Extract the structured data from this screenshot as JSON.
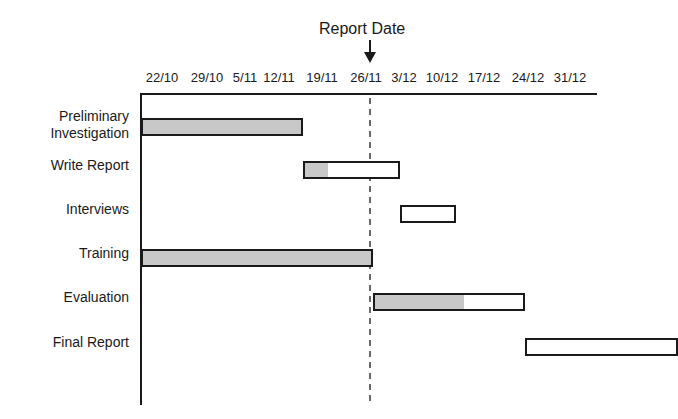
{
  "chart_data": {
    "type": "gantt",
    "title": "",
    "annotation": {
      "label": "Report Date",
      "date": "30/11",
      "marker": "down-arrow-with-dashed-line"
    },
    "x_ticks": [
      "22/10",
      "29/10",
      "5/11",
      "12/11",
      "19/11",
      "26/11",
      "3/12",
      "10/12",
      "17/12",
      "24/12",
      "31/12"
    ],
    "x_unit": "week starting date",
    "tasks": [
      {
        "name": "Preliminary Investigation",
        "label_lines": [
          "Preliminary",
          "Investigation"
        ],
        "start": "22/10",
        "end": "15/11",
        "start_week": 0,
        "duration_weeks": 3.5,
        "percent_complete": 100
      },
      {
        "name": "Write Report",
        "label_lines": [
          "Write Report"
        ],
        "start": "15/11",
        "end": "30/11",
        "start_week": 3.5,
        "duration_weeks": 2.1,
        "percent_complete": 25
      },
      {
        "name": "Interviews",
        "label_lines": [
          "Interviews"
        ],
        "start": "30/11",
        "end": "7/12",
        "start_week": 5.6,
        "duration_weeks": 1.2,
        "percent_complete": 0
      },
      {
        "name": "Training",
        "label_lines": [
          "Training"
        ],
        "start": "22/10",
        "end": "22/11",
        "start_week": 0,
        "duration_weeks": 5.0,
        "percent_complete": 100
      },
      {
        "name": "Evaluation",
        "label_lines": [
          "Evaluation"
        ],
        "start": "22/11",
        "end": "15/12",
        "start_week": 5.0,
        "duration_weeks": 3.3,
        "percent_complete": 60
      },
      {
        "name": "Final Report",
        "label_lines": [
          "Final Report"
        ],
        "start": "15/12",
        "end": "4/1",
        "start_week": 8.3,
        "duration_weeks": 3.3,
        "percent_complete": 0
      }
    ],
    "legend": [
      {
        "label": "completed",
        "color": "#c8c8c8"
      },
      {
        "label": "remaining",
        "color": "#ffffff"
      }
    ],
    "grid": false
  }
}
